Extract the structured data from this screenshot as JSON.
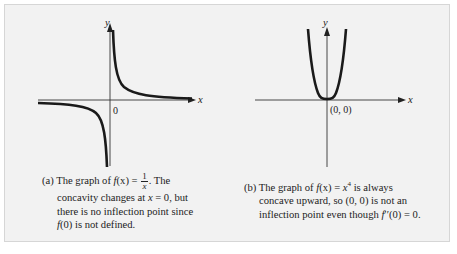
{
  "figure_a": {
    "function": "f(x) = 1/x",
    "axis_labels": {
      "x": "x",
      "y": "y"
    },
    "origin_label": "0",
    "caption": {
      "tag": "(a)",
      "pre": "The graph of ",
      "f": "f",
      "fx": "(x) = ",
      "frac_num": "1",
      "frac_den": "x",
      "post": ". The",
      "line2_pre": "concavity changes at ",
      "line2_var": "x",
      "line2_post": " = 0, but",
      "line3": "there is no inflection point since",
      "line4_f": "f",
      "line4_post": "(0) is not defined."
    }
  },
  "figure_b": {
    "function": "f(x) = x^4",
    "axis_labels": {
      "x": "x",
      "y": "y"
    },
    "origin_label": "(0, 0)",
    "caption": {
      "tag": "(b)",
      "pre": "The graph of ",
      "f": "f",
      "fx": "(x) = ",
      "var": "x",
      "exp": "4",
      "post": " is always",
      "line2": "concave upward, so (0, 0) is not an",
      "line3_pre": "inflection point even though ",
      "line3_f": "f",
      "line3_post": "′′(0) = 0."
    }
  },
  "colors": {
    "panel_bg": "#f2f2f2",
    "curve": "#1a1a1a",
    "axis": "#333333"
  }
}
